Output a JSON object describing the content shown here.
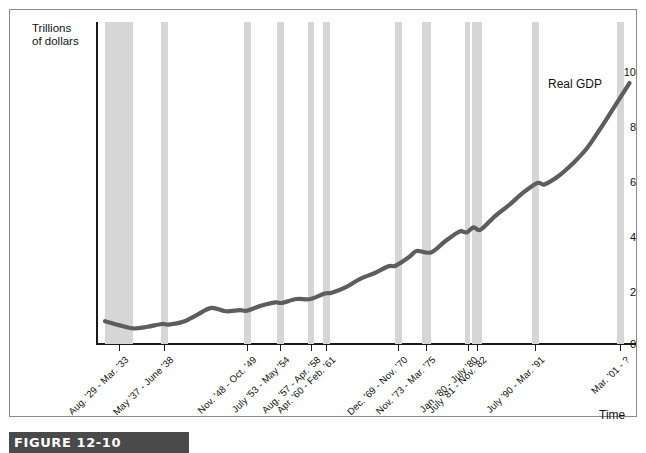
{
  "figure": {
    "caption": "FIGURE 12-10",
    "series_label": "Real GDP",
    "y_axis_title_line1": "Trillions",
    "y_axis_title_line2": "of dollars",
    "x_axis_title": "Time",
    "band_color": "#d6d6d6",
    "line_color": "#5d5d5d",
    "axis_color": "#1a1a1a"
  },
  "chart_data": {
    "type": "line",
    "title": "",
    "xlabel": "Time",
    "ylabel": "Trillions of dollars",
    "ylim": [
      0,
      11.6
    ],
    "yticks": [
      0,
      2,
      4,
      6,
      8,
      10
    ],
    "ytick_labels": [
      "0",
      "2",
      "4",
      "6",
      "8",
      "10"
    ],
    "grid": false,
    "legend": "inline",
    "series": [
      {
        "name": "Real GDP",
        "x": [
          1929,
          1931,
          1933,
          1935,
          1937,
          1938,
          1940,
          1942,
          1944,
          1946,
          1948,
          1949,
          1951,
          1953,
          1954,
          1956,
          1958,
          1960,
          1961,
          1963,
          1965,
          1967,
          1969,
          1970,
          1972,
          1973,
          1975,
          1977,
          1979,
          1980,
          1981,
          1982,
          1984,
          1986,
          1988,
          1990,
          1991,
          1993,
          1995,
          1997,
          1999,
          2001,
          2003
        ],
        "values": [
          0.82,
          0.68,
          0.56,
          0.62,
          0.72,
          0.7,
          0.8,
          1.05,
          1.3,
          1.18,
          1.22,
          1.2,
          1.38,
          1.5,
          1.48,
          1.62,
          1.62,
          1.82,
          1.85,
          2.05,
          2.35,
          2.55,
          2.8,
          2.82,
          3.15,
          3.35,
          3.3,
          3.7,
          4.05,
          4.02,
          4.2,
          4.12,
          4.6,
          5.0,
          5.45,
          5.8,
          5.75,
          6.05,
          6.5,
          7.05,
          7.8,
          8.6,
          9.4
        ],
        "note": "Approximate real GDP path read from the plotted curve"
      }
    ],
    "recession_bands": [
      {
        "label": "Aug. '29 - Mar. '33",
        "start": 1929.6,
        "end": 1933.25
      },
      {
        "label": "May '37 - June '38",
        "start": 1937.4,
        "end": 1938.5
      },
      {
        "label": "Nov. '48 - Oct. '49",
        "start": 1948.9,
        "end": 1949.8
      },
      {
        "label": "July '53 - May '54",
        "start": 1953.5,
        "end": 1954.4
      },
      {
        "label": "Aug. '57 - Apr. '58",
        "start": 1957.6,
        "end": 1958.3
      },
      {
        "label": "Apr. '60 - Feb. '61",
        "start": 1960.3,
        "end": 1961.1
      },
      {
        "label": "Dec. '69 - Nov. '70",
        "start": 1969.9,
        "end": 1970.9
      },
      {
        "label": "Nov. '73 - Mar. '75",
        "start": 1973.9,
        "end": 1975.2
      },
      {
        "label": "Jan. '80 - July '80",
        "start": 1980.0,
        "end": 1980.5
      },
      {
        "label": "July '81 - Nov. '82",
        "start": 1981.5,
        "end": 1982.9
      },
      {
        "label": "July '90 - Mar. '91",
        "start": 1990.5,
        "end": 1991.2
      },
      {
        "label": "Mar. '01 - ?",
        "start": 2001.2,
        "end": 2001.9
      }
    ],
    "xtick_labels": [
      "Aug. '29 - Mar. '33",
      "May '37 - June '38",
      "Nov. '48 - Oct. '49",
      "July '53 - May '54",
      "Aug. '57 - Apr. '58",
      "Apr. '60 - Feb. '61",
      "Dec. '69 - Nov. '70",
      "Nov. '73 - Mar. '75",
      "Jan. '80 - July '80",
      "July '81 - Nov. '82",
      "July '90 - Mar. '91",
      "Mar. '01 - ?"
    ]
  }
}
